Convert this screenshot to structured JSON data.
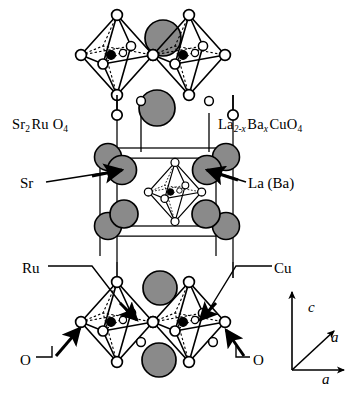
{
  "figure": {
    "background_color": "#ffffff",
    "line_color": "#000000",
    "sphere_fill": "#8a8a8a",
    "vertex_fill": "#ffffff",
    "center_fill": "#000000"
  },
  "formulas": {
    "left": {
      "parts": [
        {
          "text": "Sr",
          "sub": "2",
          "italic_sub": false
        },
        {
          "text": "Ru",
          "sub": "",
          "italic_sub": false
        },
        {
          "text": "O",
          "sub": "4",
          "italic_sub": false
        }
      ],
      "plain": "Sr2RuO4"
    },
    "right": {
      "parts": [
        {
          "text": "La",
          "sub": "2-x",
          "italic_sub": true
        },
        {
          "text": "Ba",
          "sub": "x",
          "italic_sub": true
        },
        {
          "text": "CuO",
          "sub": "4",
          "italic_sub": false
        }
      ],
      "plain": "La2-xBaxCuO4"
    }
  },
  "labels": {
    "sr": "Sr",
    "la_ba": "La (Ba)",
    "ru": "Ru",
    "cu": "Cu",
    "o_left": "O",
    "o_right": "O"
  },
  "axes": {
    "c": "c",
    "a_diagonal": "a",
    "a_horizontal": "a"
  },
  "legend_semantics": {
    "gray_sphere": "Sr / La (Ba) cation",
    "white_circle": "O oxygen at octahedron vertex",
    "black_circle": "Ru / Cu at octahedron center",
    "solid_line": "visible edge",
    "dashed_line": "hidden edge"
  }
}
